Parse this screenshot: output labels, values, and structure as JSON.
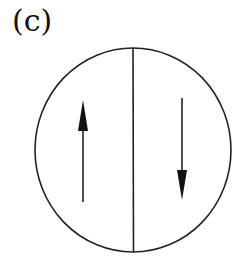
{
  "panel": {
    "label": "(c)"
  },
  "diagram": {
    "stroke_color": "#222222",
    "circle": {
      "cx": 133,
      "cy": 150,
      "rx": 98,
      "ry": 102
    },
    "divider": {
      "x": 133,
      "y1": 48,
      "y2": 252
    },
    "arrows": [
      {
        "direction": "up",
        "x": 83,
        "tail_y": 202,
        "head_y": 100
      },
      {
        "direction": "down",
        "x": 182,
        "tail_y": 98,
        "head_y": 200
      }
    ]
  }
}
